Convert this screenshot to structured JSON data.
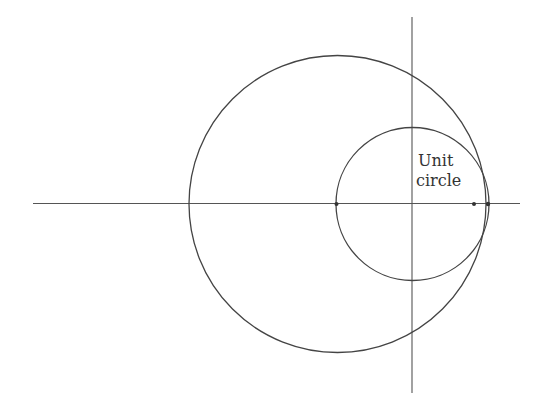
{
  "canvas": {
    "width": 539,
    "height": 410,
    "background": "#ffffff"
  },
  "colors": {
    "stroke": "#444444",
    "axis": "#555555",
    "point": "#333333",
    "text": "#333333"
  },
  "axes": {
    "horizontal": {
      "x1": 33,
      "y1": 203.5,
      "x2": 520,
      "y2": 203.5
    },
    "vertical": {
      "x1": 412,
      "y1": 17,
      "x2": 412,
      "y2": 393
    }
  },
  "circles": [
    {
      "name": "large-circle",
      "cx": 337.5,
      "cy": 204,
      "r": 148.5
    },
    {
      "name": "unit-circle",
      "cx": 412.5,
      "cy": 204,
      "r": 76.5
    }
  ],
  "points": [
    {
      "name": "point-left",
      "cx": 336.5,
      "cy": 204,
      "r": 2
    },
    {
      "name": "point-right-inner",
      "cx": 474,
      "cy": 204,
      "r": 2
    },
    {
      "name": "point-right-outer",
      "cx": 488,
      "cy": 204,
      "r": 2.2
    }
  ],
  "label": {
    "line1": "Unit",
    "line2": "circle",
    "line1_pos": {
      "x": 418,
      "y": 166
    },
    "line2_pos": {
      "x": 416,
      "y": 186
    }
  }
}
